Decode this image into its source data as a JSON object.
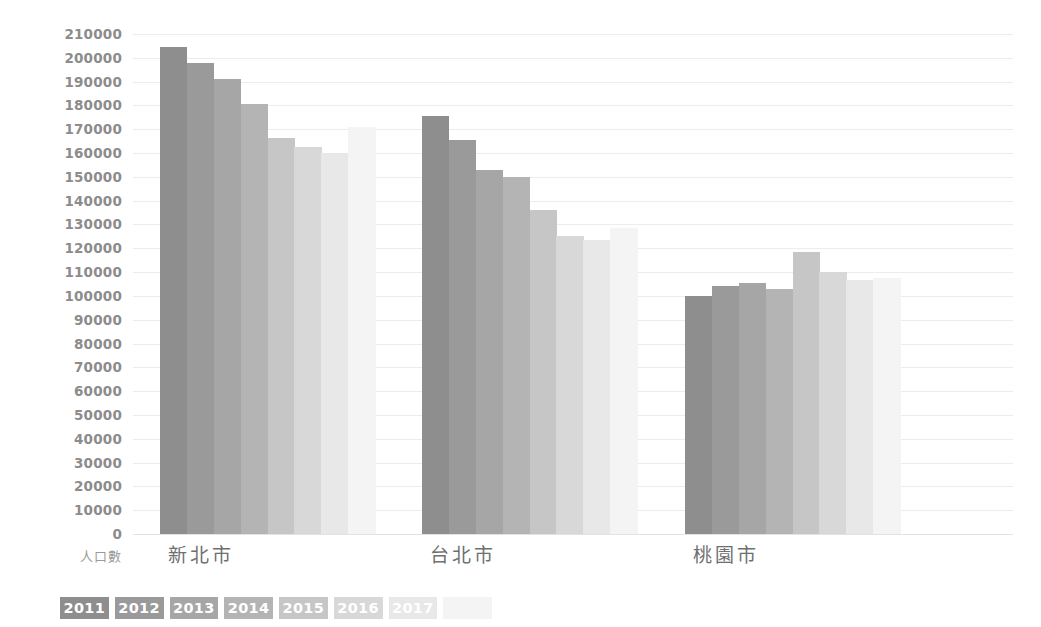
{
  "chart_data": {
    "type": "bar",
    "title": "",
    "subtitle": "",
    "xlabel": "",
    "ylabel": "人口數",
    "ylim": [
      0,
      210000
    ],
    "ytick_step": 10000,
    "yticks": [
      210000,
      200000,
      190000,
      180000,
      170000,
      160000,
      150000,
      140000,
      130000,
      120000,
      110000,
      100000,
      90000,
      80000,
      70000,
      60000,
      50000,
      40000,
      30000,
      20000,
      10000,
      0
    ],
    "ytick_labels": [
      "210000",
      "200000",
      "190000",
      "180000",
      "170000",
      "160000",
      "150000",
      "140000",
      "130000",
      "120000",
      "110000",
      "100000",
      "90000",
      "80000",
      "70000",
      "60000",
      "50000",
      "40000",
      "30000",
      "20000",
      "10000",
      "0"
    ],
    "categories": [
      "新北市",
      "台北市",
      "桃園市"
    ],
    "legend_position": "bottom-left",
    "grid": true,
    "series": [
      {
        "name": "2011",
        "color": "#8e8e8e",
        "values": [
          204500,
          175500,
          100000
        ]
      },
      {
        "name": "2012",
        "color": "#9a9a9a",
        "values": [
          198000,
          165500,
          104000
        ]
      },
      {
        "name": "2013",
        "color": "#a6a6a6",
        "values": [
          191000,
          153000,
          105500
        ]
      },
      {
        "name": "2014",
        "color": "#b4b4b4",
        "values": [
          180500,
          150000,
          103000
        ]
      },
      {
        "name": "2015",
        "color": "#c6c6c6",
        "values": [
          166500,
          136000,
          118500
        ]
      },
      {
        "name": "2016",
        "color": "#d8d8d8",
        "values": [
          162500,
          125000,
          110000
        ]
      },
      {
        "name": "2017",
        "color": "#e8e8e8",
        "values": [
          160000,
          123500,
          106500
        ]
      },
      {
        "name": "",
        "color": "#f4f4f4",
        "values": [
          171000,
          128500,
          107500
        ]
      }
    ]
  },
  "legend": {
    "labels": [
      "2011",
      "2012",
      "2013",
      "2014",
      "2015",
      "2016",
      "2017",
      ""
    ]
  },
  "axis": {
    "y_title": "人口數"
  }
}
